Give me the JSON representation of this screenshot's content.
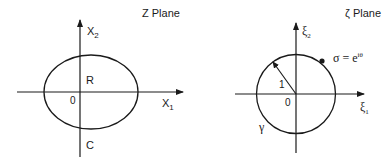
{
  "left_panel": {
    "title": "Z Plane",
    "x_axis_label": "X",
    "x_axis_sub": "1",
    "y_axis_label": "X",
    "y_axis_sub": "2",
    "origin_label": "0",
    "region_label": "R",
    "curve_label": "C"
  },
  "right_panel": {
    "title": "ζ Plane",
    "x_axis_label": "ξ",
    "x_axis_sub": "1",
    "y_axis_label": "ξ",
    "y_axis_sub": "2",
    "origin_label": "0",
    "radius_label": "1",
    "curve_label": "γ",
    "point_label_base": "σ = e",
    "point_label_sup": "iθ"
  },
  "colors": {
    "stroke": "#1a1a1a",
    "background": "#ffffff"
  }
}
